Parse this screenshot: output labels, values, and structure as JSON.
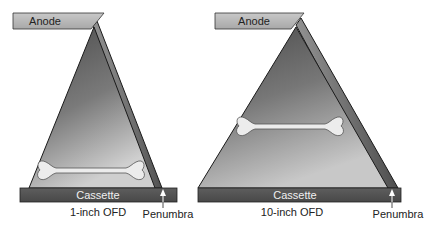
{
  "diagrams": [
    {
      "anode_label": "Anode",
      "cassette_label": "Cassette",
      "ofd_label": "1-inch OFD",
      "penumbra_label": "Penumbra"
    },
    {
      "anode_label": "Anode",
      "cassette_label": "Cassette",
      "ofd_label": "10-inch OFD",
      "penumbra_label": "Penumbra"
    }
  ],
  "colors": {
    "anode_fill": "#b9b9b9",
    "cassette_fill": "#555555",
    "beam_dark": "#3a3a3a",
    "beam_light": "#b4b4b4",
    "bone_fill": "#ececec",
    "outline": "#1a1a1a"
  }
}
